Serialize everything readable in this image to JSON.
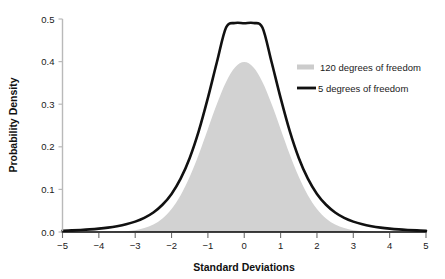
{
  "chart_data": {
    "type": "area",
    "title": "",
    "xlabel": "Standard Deviations",
    "ylabel": "Probability Density",
    "xlim": [
      -5,
      5
    ],
    "ylim": [
      0,
      0.5
    ],
    "grid": false,
    "legend_position": "right",
    "xticks": [
      "-5",
      "-4",
      "-3",
      "-2",
      "-1",
      "0",
      "1",
      "2",
      "3",
      "4",
      "5"
    ],
    "xtick_values": [
      -5,
      -4,
      -3,
      -2,
      -1,
      0,
      1,
      2,
      3,
      4,
      5
    ],
    "yticks": [
      "0.0",
      "0.1",
      "0.2",
      "0.3",
      "0.4",
      "0.5"
    ],
    "ytick_values": [
      0.0,
      0.1,
      0.2,
      0.3,
      0.4,
      0.5
    ],
    "series": [
      {
        "name": "120 degrees of freedom",
        "render": "filled-area",
        "color": "#d2d2d2",
        "peak": 0.399,
        "x": [
          -5.0,
          -4.75,
          -4.5,
          -4.25,
          -4.0,
          -3.75,
          -3.5,
          -3.25,
          -3.0,
          -2.75,
          -2.5,
          -2.25,
          -2.0,
          -1.75,
          -1.5,
          -1.25,
          -1.0,
          -0.75,
          -0.5,
          -0.25,
          0.0,
          0.25,
          0.5,
          0.75,
          1.0,
          1.25,
          1.5,
          1.75,
          2.0,
          2.25,
          2.5,
          2.75,
          3.0,
          3.25,
          3.5,
          3.75,
          4.0,
          4.25,
          4.5,
          4.75,
          5.0
        ],
        "values": [
          0.0,
          0.0,
          0.0,
          0.0001,
          0.0002,
          0.0004,
          0.0009,
          0.002,
          0.0044,
          0.0091,
          0.0175,
          0.0317,
          0.054,
          0.0863,
          0.1295,
          0.1826,
          0.242,
          0.3011,
          0.3521,
          0.3867,
          0.3989,
          0.3867,
          0.3521,
          0.3011,
          0.242,
          0.1826,
          0.1295,
          0.0863,
          0.054,
          0.0317,
          0.0175,
          0.0091,
          0.0044,
          0.002,
          0.0009,
          0.0004,
          0.0002,
          0.0001,
          0.0,
          0.0,
          0.0
        ]
      },
      {
        "name": "5 degrees of freedom",
        "render": "line",
        "color": "#111111",
        "peak": 0.49,
        "x": [
          -5.0,
          -4.75,
          -4.5,
          -4.25,
          -4.0,
          -3.75,
          -3.5,
          -3.25,
          -3.0,
          -2.75,
          -2.5,
          -2.25,
          -2.0,
          -1.75,
          -1.5,
          -1.25,
          -1.0,
          -0.75,
          -0.5,
          -0.25,
          0.0,
          0.25,
          0.5,
          0.75,
          1.0,
          1.25,
          1.5,
          1.75,
          2.0,
          2.25,
          2.5,
          2.75,
          3.0,
          3.25,
          3.5,
          3.75,
          4.0,
          4.25,
          4.5,
          4.75,
          5.0
        ],
        "values": [
          0.0031,
          0.0038,
          0.0048,
          0.0061,
          0.0079,
          0.0103,
          0.0136,
          0.0181,
          0.0244,
          0.0333,
          0.0459,
          0.0639,
          0.0894,
          0.1251,
          0.1738,
          0.2373,
          0.3147,
          0.3996,
          0.48,
          0.4905,
          0.49,
          0.4905,
          0.48,
          0.3996,
          0.3147,
          0.2373,
          0.1738,
          0.1251,
          0.0894,
          0.0639,
          0.0459,
          0.0333,
          0.0244,
          0.0181,
          0.0136,
          0.0103,
          0.0079,
          0.0061,
          0.0048,
          0.0038,
          0.0031
        ]
      }
    ],
    "legend": [
      {
        "label": "120 degrees of freedom",
        "swatch": "gray-block",
        "color": "#cccccc"
      },
      {
        "label": "5 degrees of freedom",
        "swatch": "black-line",
        "color": "#111111"
      }
    ]
  }
}
